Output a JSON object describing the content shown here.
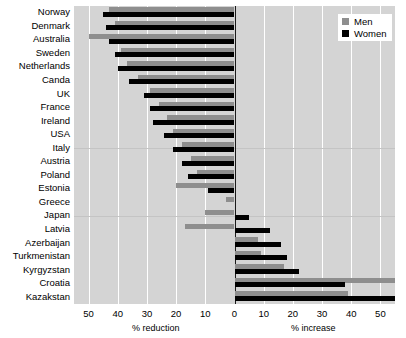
{
  "chart_data": {
    "type": "bar",
    "orientation": "horizontal",
    "title": "",
    "subtitle": "",
    "xlabel_left": "% reduction",
    "xlabel_right": "% increase",
    "ylabel": "",
    "xlim": [
      -55,
      55
    ],
    "xticks": [
      -50,
      -40,
      -30,
      -20,
      -10,
      0,
      10,
      20,
      30,
      40,
      50
    ],
    "xticklabels": [
      "50",
      "40",
      "30",
      "20",
      "10",
      "0",
      "10",
      "20",
      "30",
      "40",
      "50"
    ],
    "grid": "vertical",
    "legend": {
      "position": "top-right",
      "entries": [
        {
          "name": "Men",
          "color": "#8e8e8e"
        },
        {
          "name": "Women",
          "color": "#000000"
        }
      ]
    },
    "categories": [
      "Norway",
      "Denmark",
      "Australia",
      "Sweden",
      "Netherlands",
      "Canda",
      "UK",
      "France",
      "Ireland",
      "USA",
      "Italy",
      "Austria",
      "Poland",
      "Estonia",
      "Greece",
      "Japan",
      "Latvia",
      "Azerbaijan",
      "Turkmenistan",
      "Kyrgyzstan",
      "Croatia",
      "Kazakstan"
    ],
    "series": [
      {
        "name": "Men",
        "color": "#8e8e8e",
        "values": [
          -43,
          -41,
          -50,
          -39,
          -37,
          -33,
          -29,
          -26,
          -23,
          -21,
          -18,
          -15,
          -13,
          -20,
          -3,
          -10,
          -17,
          8,
          9,
          17,
          56,
          39
        ]
      },
      {
        "name": "Women",
        "color": "#000000",
        "values": [
          -45,
          -44,
          -43,
          -41,
          -40,
          -36,
          -31,
          -29,
          -28,
          -24,
          -21,
          -18,
          -16,
          -9,
          0,
          5,
          12,
          16,
          18,
          22,
          38,
          58
        ]
      }
    ]
  }
}
